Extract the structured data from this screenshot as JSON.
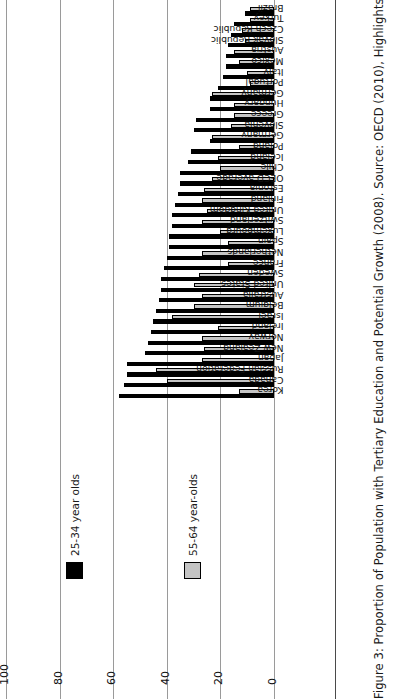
{
  "caption": "Figure 3: Proportion of Population with Tertiary Education and Potential Growth (2008). Source: OECD (2010), Highlights from Education",
  "legend": {
    "items": [
      {
        "label": "25-34 year olds",
        "color": "#000000"
      },
      {
        "label": "55-64 year-olds",
        "color": "#c4c4c4"
      }
    ]
  },
  "chart_data": {
    "type": "bar",
    "title": "",
    "xlabel": "",
    "ylabel": "",
    "ylim": [
      0,
      100
    ],
    "yticks": [
      0,
      20,
      40,
      60,
      80,
      100
    ],
    "grid": true,
    "orientation": "vertical",
    "legend_position": "left",
    "categories": [
      "Korea",
      "Canada",
      "Russian Federation",
      "Japan",
      "New Zealand",
      "Norway",
      "Ireland",
      "Israel",
      "Belgium",
      "Australia",
      "United States",
      "Sweden",
      "France",
      "Netherlands",
      "Spain",
      "Luxembourg",
      "Switzerland",
      "United Kingdom",
      "Finland",
      "Estonia",
      "OECD average",
      "Chile",
      "Iceland",
      "Poland",
      "Germany",
      "Slovenia",
      "Greece",
      "Hungary",
      "Germany",
      "Portugal",
      "Italy",
      "Mexico",
      "Austria",
      "Slovak Republic",
      "Czech Republic",
      "Turkey",
      "Brazil"
    ],
    "series": [
      {
        "name": "25-34 year olds",
        "color": "#000000",
        "values": [
          58,
          56,
          55,
          55,
          48,
          47,
          46,
          45,
          44,
          43,
          42,
          42,
          41,
          40,
          39,
          39,
          38,
          38,
          37,
          36,
          35,
          35,
          32,
          31,
          24,
          30,
          29,
          24,
          24,
          21,
          19,
          18,
          18,
          17,
          16,
          15,
          11
        ]
      },
      {
        "name": "55-64 year-olds",
        "color": "#c4c4c4",
        "values": [
          13,
          40,
          44,
          27,
          26,
          27,
          21,
          38,
          30,
          27,
          30,
          28,
          17,
          27,
          17,
          20,
          27,
          25,
          27,
          26,
          23,
          20,
          21,
          13,
          23,
          16,
          15,
          15,
          23,
          9,
          10,
          13,
          15,
          11,
          12,
          9,
          9
        ]
      }
    ]
  }
}
